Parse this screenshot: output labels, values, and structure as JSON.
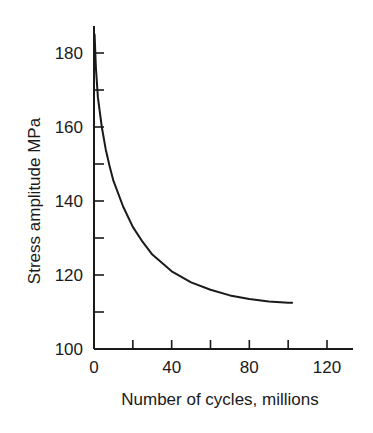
{
  "chart_data": {
    "type": "line",
    "title": "",
    "xlabel": "Number of cycles, millions",
    "ylabel": "Stress amplitude MPa",
    "xlim": [
      0,
      130
    ],
    "ylim": [
      100,
      186
    ],
    "x_ticks_major": [
      0,
      40,
      80,
      120
    ],
    "x_ticks_minor": [
      20,
      60,
      100
    ],
    "y_ticks_major": [
      100,
      120,
      140,
      160,
      180
    ],
    "y_ticks_minor": [
      110,
      130,
      150,
      170
    ],
    "grid": false,
    "legend": null,
    "series": [
      {
        "name": "S-N curve",
        "color": "#1a1a1a",
        "x": [
          0.3,
          1,
          2,
          4,
          6,
          8,
          10,
          15,
          20,
          25,
          30,
          40,
          50,
          60,
          70,
          80,
          90,
          100,
          102
        ],
        "y": [
          185,
          176,
          168,
          160,
          154,
          149.5,
          145.5,
          138.5,
          133,
          129,
          125.5,
          121,
          118,
          116,
          114.5,
          113.5,
          112.8,
          112.5,
          112.5
        ]
      }
    ]
  }
}
